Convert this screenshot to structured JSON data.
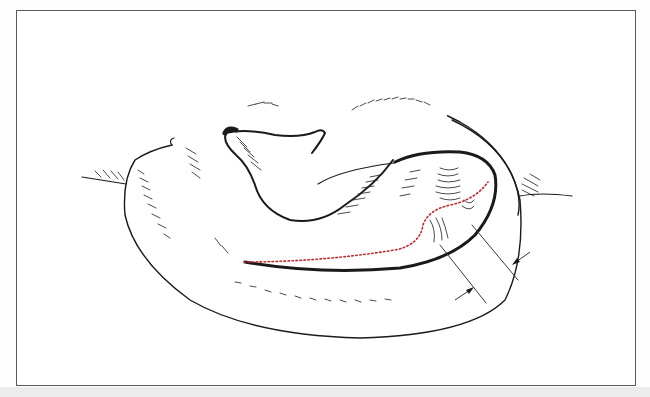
{
  "figure": {
    "background_color": "#ffffff",
    "frame_color": "#5a5a5a",
    "line_color": "#1a1a1a",
    "incision_color": "#c0282d"
  },
  "annotations": {
    "incision_line": "dotted-red",
    "measurement_arrows": 2
  }
}
